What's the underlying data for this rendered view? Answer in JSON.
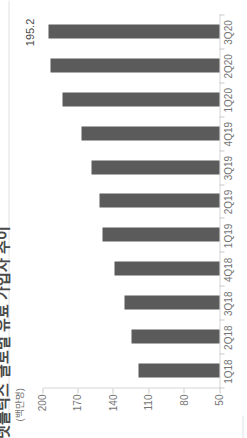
{
  "chart_data": {
    "type": "bar",
    "title_clipped": "넷플릭스 글로벌 유료 가입자 추이",
    "unit_label": "(백만명)",
    "categories": [
      "1Q18",
      "2Q18",
      "3Q18",
      "4Q18",
      "1Q19",
      "2Q19",
      "3Q19",
      "4Q19",
      "1Q20",
      "2Q20",
      "3Q20"
    ],
    "values": [
      118.9,
      124.4,
      130.4,
      139.3,
      148.9,
      151.6,
      158.3,
      167.1,
      182.9,
      192.9,
      195.2
    ],
    "data_label": {
      "category": "3Q20",
      "text": "195.2"
    },
    "y_ticks": [
      200,
      170,
      140,
      110,
      80,
      50
    ],
    "ylim": [
      50,
      200
    ],
    "grid": "off",
    "legend": "none",
    "orientation": "image rotated 90deg counter-clockwise (categories read bottom-to-top on right edge)",
    "colors": {
      "bar": "#5b5b5b",
      "axis_line": "#d6d6d6",
      "tick_mark": "#c9c9c9",
      "tick_text": "#757575",
      "title_text": "#4a4a4a",
      "annotation_text": "#4a4a4a",
      "background": "#ffffff"
    }
  }
}
